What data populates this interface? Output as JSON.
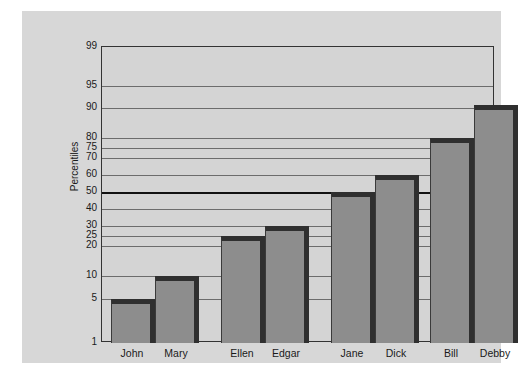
{
  "chart_data": {
    "type": "bar",
    "title": "",
    "xlabel": "",
    "ylabel": "Percentiles",
    "scale": "normal-probability",
    "ylim": [
      1,
      99
    ],
    "grid": true,
    "legend": "none",
    "categories": [
      "John",
      "Mary",
      "Ellen",
      "Edgar",
      "Jane",
      "Dick",
      "Bill",
      "Debby"
    ],
    "values": [
      5,
      10,
      25,
      30,
      50,
      60,
      80,
      91
    ],
    "groups": [
      {
        "members": [
          "John",
          "Mary"
        ]
      },
      {
        "members": [
          "Ellen",
          "Edgar"
        ]
      },
      {
        "members": [
          "Jane",
          "Dick"
        ]
      },
      {
        "members": [
          "Bill",
          "Debby"
        ]
      }
    ],
    "yticks": [
      {
        "label": "99",
        "value": 99,
        "y": 35,
        "major": false
      },
      {
        "label": "95",
        "value": 95,
        "y": 74,
        "major": false
      },
      {
        "label": "90",
        "value": 90,
        "y": 96,
        "major": false
      },
      {
        "label": "80",
        "value": 80,
        "y": 126,
        "major": false
      },
      {
        "label": "75",
        "value": 75,
        "y": 136,
        "major": false
      },
      {
        "label": "70",
        "value": 70,
        "y": 146,
        "major": false
      },
      {
        "label": "60",
        "value": 60,
        "y": 163,
        "major": false
      },
      {
        "label": "50",
        "value": 50,
        "y": 180,
        "major": true
      },
      {
        "label": "40",
        "value": 40,
        "y": 197,
        "major": false
      },
      {
        "label": "30",
        "value": 30,
        "y": 214,
        "major": false
      },
      {
        "label": "25",
        "value": 25,
        "y": 224,
        "major": false
      },
      {
        "label": "20",
        "value": 20,
        "y": 234,
        "major": false
      },
      {
        "label": "10",
        "value": 10,
        "y": 264,
        "major": false
      },
      {
        "label": "5",
        "value": 5,
        "y": 287,
        "major": false
      },
      {
        "label": "1",
        "value": 1,
        "y": 331,
        "major": false
      }
    ],
    "bars": [
      {
        "label": "John",
        "value": 5,
        "x": 88,
        "w": 44,
        "top": 287
      },
      {
        "label": "Mary",
        "value": 10,
        "x": 132,
        "w": 44,
        "top": 264
      },
      {
        "label": "Ellen",
        "value": 25,
        "x": 198,
        "w": 44,
        "top": 224
      },
      {
        "label": "Edgar",
        "value": 30,
        "x": 242,
        "w": 44,
        "top": 214
      },
      {
        "label": "Jane",
        "value": 50,
        "x": 308,
        "w": 44,
        "top": 180
      },
      {
        "label": "Dick",
        "value": 60,
        "x": 352,
        "w": 44,
        "top": 163
      },
      {
        "label": "Bill",
        "value": 80,
        "x": 407,
        "w": 44,
        "top": 126
      },
      {
        "label": "Debby",
        "value": 91,
        "x": 451,
        "w": 44,
        "top": 93
      }
    ],
    "colors": {
      "bar_fill": "#8d8d8d",
      "bar_edge": "#2f2f2f",
      "plot_background": "#d4d4d4",
      "canvas_background": "#d7d7d7",
      "page_background": "#ffffff",
      "gridline": "#4a4a4a",
      "median_line": "#111111",
      "text": "#1a1a1a"
    }
  }
}
